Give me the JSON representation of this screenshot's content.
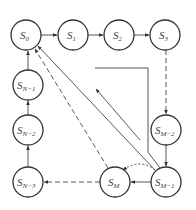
{
  "diagram": {
    "type": "state-transition",
    "nodes": [
      {
        "id": "S0",
        "base": "S",
        "sub": "0",
        "cx": 26,
        "cy": 35
      },
      {
        "id": "S1",
        "base": "S",
        "sub": "1",
        "cx": 73,
        "cy": 35
      },
      {
        "id": "S2",
        "base": "S",
        "sub": "2",
        "cx": 119,
        "cy": 35
      },
      {
        "id": "S3",
        "base": "S",
        "sub": "3",
        "cx": 165,
        "cy": 35
      },
      {
        "id": "SM-2",
        "base": "S",
        "sub": "M−2",
        "cx": 166,
        "cy": 130
      },
      {
        "id": "SM-1",
        "base": "S",
        "sub": "M−1",
        "cx": 166,
        "cy": 182
      },
      {
        "id": "SM",
        "base": "S",
        "sub": "M",
        "cx": 115,
        "cy": 182
      },
      {
        "id": "SN-3",
        "base": "S",
        "sub": "N−3",
        "cx": 28,
        "cy": 182
      },
      {
        "id": "SN-2",
        "base": "S",
        "sub": "N−2",
        "cx": 28,
        "cy": 130
      },
      {
        "id": "SN-1",
        "base": "S",
        "sub": "N−1",
        "cx": 28,
        "cy": 85
      }
    ],
    "edges": [
      {
        "from": "S0",
        "to": "S1",
        "style": "solid"
      },
      {
        "from": "S1",
        "to": "S2",
        "style": "solid"
      },
      {
        "from": "S2",
        "to": "S3",
        "style": "solid"
      },
      {
        "from": "S3",
        "to": "SM-2",
        "style": "dashed"
      },
      {
        "from": "SM-2",
        "to": "SM-1",
        "style": "solid"
      },
      {
        "from": "SM-1",
        "to": "SM",
        "style": "solid"
      },
      {
        "from": "SM",
        "to": "SN-3",
        "style": "dashed"
      },
      {
        "from": "SN-3",
        "to": "SN-2",
        "style": "solid"
      },
      {
        "from": "SN-2",
        "to": "SN-1",
        "style": "solid"
      },
      {
        "from": "SN-1",
        "to": "S0",
        "style": "solid"
      },
      {
        "from": "SM-1",
        "to": "S0",
        "style": "solid",
        "note": "diagonal return"
      },
      {
        "from": "SM",
        "to": "S0",
        "style": "dashed",
        "note": "diagonal return"
      },
      {
        "from": "SM-1",
        "to": "SM",
        "style": "dotted",
        "note": "curved arc"
      },
      {
        "from": "SM-1",
        "to": "inner",
        "style": "solid",
        "note": "inner bracket path with arrow"
      }
    ]
  }
}
